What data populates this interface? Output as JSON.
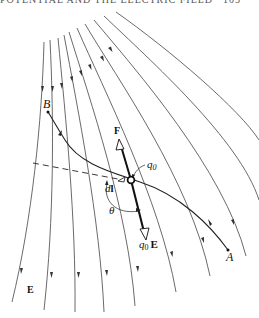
{
  "header": {
    "running_title": "POTENTIAL AND THE ELECTRIC FIELD",
    "page_number": "105"
  },
  "figure": {
    "labels": {
      "point_b": "B",
      "point_a": "A",
      "force": "F",
      "charge": "q",
      "charge_sub": "0",
      "field_force_q": "q",
      "field_force_sub": "0",
      "field_force_e": "E",
      "displacement_d": "d",
      "displacement_l": "l",
      "angle": "θ",
      "field": "E"
    },
    "colors": {
      "line": "#222222",
      "field_line": "#444444",
      "background": "#ffffff"
    },
    "field_line_count": 10
  }
}
